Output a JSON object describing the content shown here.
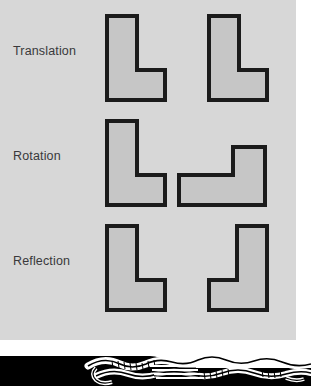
{
  "figure": {
    "panel_background": "#d7d7d7",
    "shape_fill": "#c6c6c6",
    "shape_stroke": "#1b1b1b",
    "label_color": "#39393b",
    "rows": [
      {
        "label": "Translation",
        "original": {
          "name": "L-shape",
          "orientation": "upright"
        },
        "transformed": {
          "name": "L-shape",
          "orientation": "upright-shifted-right"
        }
      },
      {
        "label": "Rotation",
        "original": {
          "name": "L-shape",
          "orientation": "upright"
        },
        "transformed": {
          "name": "L-shape",
          "orientation": "rotated-90-counterclockwise"
        }
      },
      {
        "label": "Reflection",
        "original": {
          "name": "L-shape",
          "orientation": "upright"
        },
        "transformed": {
          "name": "L-shape",
          "orientation": "mirrored-horizontally"
        }
      }
    ]
  },
  "bottom_artwork": {
    "description": "black-and-white line-art illustration fragment",
    "ink_color": "#000000",
    "paper_color": "#ffffff"
  }
}
